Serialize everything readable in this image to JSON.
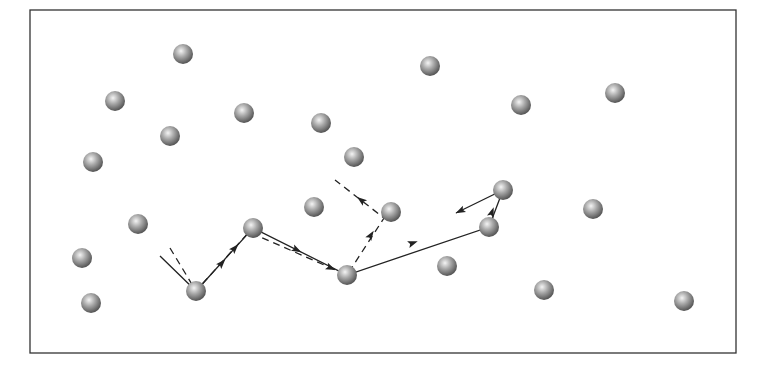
{
  "diagram": {
    "type": "particle-trajectory",
    "frame": {
      "x": 30,
      "y": 10,
      "width": 706,
      "height": 343,
      "stroke": "#333333"
    },
    "sphere_style": {
      "radius": 10,
      "highlight": "#f2f2f2",
      "mid": "#a8a8a8",
      "shadow": "#5a5a5a"
    },
    "spheres": [
      {
        "id": 1,
        "x": 183,
        "y": 54
      },
      {
        "id": 2,
        "x": 115,
        "y": 101
      },
      {
        "id": 3,
        "x": 430,
        "y": 66
      },
      {
        "id": 4,
        "x": 244,
        "y": 113
      },
      {
        "id": 5,
        "x": 170,
        "y": 136
      },
      {
        "id": 6,
        "x": 321,
        "y": 123
      },
      {
        "id": 7,
        "x": 521,
        "y": 105
      },
      {
        "id": 8,
        "x": 615,
        "y": 93
      },
      {
        "id": 9,
        "x": 93,
        "y": 162
      },
      {
        "id": 10,
        "x": 354,
        "y": 157
      },
      {
        "id": 11,
        "x": 138,
        "y": 224
      },
      {
        "id": 12,
        "x": 314,
        "y": 207
      },
      {
        "id": 13,
        "x": 391,
        "y": 212
      },
      {
        "id": 14,
        "x": 503,
        "y": 190
      },
      {
        "id": 15,
        "x": 489,
        "y": 227
      },
      {
        "id": 16,
        "x": 593,
        "y": 209
      },
      {
        "id": 17,
        "x": 253,
        "y": 228
      },
      {
        "id": 18,
        "x": 82,
        "y": 258
      },
      {
        "id": 19,
        "x": 447,
        "y": 266
      },
      {
        "id": 20,
        "x": 196,
        "y": 291
      },
      {
        "id": 21,
        "x": 347,
        "y": 275
      },
      {
        "id": 22,
        "x": 91,
        "y": 303
      },
      {
        "id": 23,
        "x": 544,
        "y": 290
      },
      {
        "id": 24,
        "x": 684,
        "y": 301
      }
    ],
    "paths": [
      {
        "name": "solid-trajectory",
        "style": "solid",
        "color": "#222222",
        "points": [
          [
            160,
            256
          ],
          [
            196,
            291
          ],
          [
            253,
            228
          ],
          [
            347,
            275
          ],
          [
            489,
            227
          ],
          [
            503,
            190
          ],
          [
            456,
            213
          ]
        ],
        "arrows": [
          {
            "x": 222,
            "y": 263,
            "angle": -48
          },
          {
            "x": 297,
            "y": 250,
            "angle": 27
          },
          {
            "x": 413,
            "y": 243,
            "angle": -19
          },
          {
            "x": 492,
            "y": 212,
            "angle": -70
          },
          {
            "x": 460,
            "y": 211,
            "angle": 154
          }
        ]
      },
      {
        "name": "dashed-trajectory",
        "style": "dashed",
        "color": "#222222",
        "points": [
          [
            170,
            248
          ],
          [
            196,
            291
          ],
          [
            249,
            232
          ],
          [
            347,
            275
          ],
          [
            384,
            218
          ],
          [
            335,
            180
          ]
        ],
        "arrows": [
          {
            "x": 235,
            "y": 248,
            "angle": -48
          },
          {
            "x": 331,
            "y": 268,
            "angle": 24
          },
          {
            "x": 371,
            "y": 235,
            "angle": -57
          },
          {
            "x": 361,
            "y": 200,
            "angle": -142
          }
        ]
      }
    ]
  }
}
